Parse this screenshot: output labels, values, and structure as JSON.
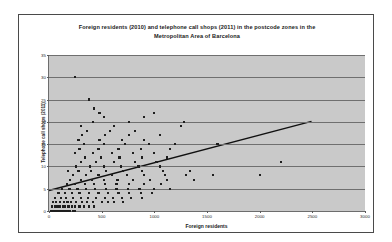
{
  "chart_data": {
    "type": "scatter",
    "title": "Foreign residents (2010) and telephone call shops (2011) in the postcode zones in the Metropolitan Area of Barcelona",
    "title_line1": "Foreign residents (2010) and telephone call shops (2011) in the postcode zones in the",
    "title_line2": "Metropolitan Area of Barcelona",
    "xlabel": "Foreign residents",
    "ylabel": "Telephone call shops (2011)",
    "xlim": [
      0,
      3000
    ],
    "ylim": [
      0,
      35
    ],
    "xticks": [
      0,
      500,
      1000,
      1500,
      2000,
      2500,
      3000
    ],
    "yticks": [
      0,
      5,
      10,
      15,
      20,
      25,
      30,
      35
    ],
    "grid": "horizontal",
    "legend": "none",
    "plot_background": "#c9c9c9",
    "gridline_color": "#6f6f6f",
    "marker_color": "#1e1e1e",
    "trendline_color": "#101010",
    "trendline": {
      "x_start": 0,
      "y_start": 4.4,
      "x_end": 2500,
      "y_end": 20.0
    },
    "points": [
      [
        20,
        0
      ],
      [
        35,
        0
      ],
      [
        50,
        0
      ],
      [
        65,
        0
      ],
      [
        80,
        0
      ],
      [
        95,
        0
      ],
      [
        110,
        0
      ],
      [
        125,
        0
      ],
      [
        145,
        0
      ],
      [
        160,
        0
      ],
      [
        180,
        0
      ],
      [
        200,
        0
      ],
      [
        225,
        0
      ],
      [
        250,
        0
      ],
      [
        30,
        1
      ],
      [
        55,
        1
      ],
      [
        75,
        1
      ],
      [
        100,
        1
      ],
      [
        130,
        1
      ],
      [
        155,
        1
      ],
      [
        185,
        1
      ],
      [
        215,
        1
      ],
      [
        245,
        1
      ],
      [
        290,
        1
      ],
      [
        330,
        1
      ],
      [
        380,
        1
      ],
      [
        430,
        1
      ],
      [
        40,
        2
      ],
      [
        70,
        2
      ],
      [
        105,
        2
      ],
      [
        140,
        2
      ],
      [
        175,
        2
      ],
      [
        210,
        2
      ],
      [
        260,
        2
      ],
      [
        310,
        2
      ],
      [
        360,
        2
      ],
      [
        420,
        2
      ],
      [
        500,
        2
      ],
      [
        560,
        2
      ],
      [
        620,
        2
      ],
      [
        700,
        2
      ],
      [
        60,
        3
      ],
      [
        115,
        3
      ],
      [
        165,
        3
      ],
      [
        230,
        3
      ],
      [
        300,
        3
      ],
      [
        370,
        3
      ],
      [
        450,
        3
      ],
      [
        530,
        3
      ],
      [
        610,
        3
      ],
      [
        690,
        3
      ],
      [
        780,
        3
      ],
      [
        880,
        3
      ],
      [
        90,
        4
      ],
      [
        150,
        4
      ],
      [
        220,
        4
      ],
      [
        290,
        4
      ],
      [
        380,
        4
      ],
      [
        470,
        4
      ],
      [
        560,
        4
      ],
      [
        660,
        4
      ],
      [
        760,
        4
      ],
      [
        870,
        4
      ],
      [
        980,
        4
      ],
      [
        120,
        5
      ],
      [
        195,
        5
      ],
      [
        270,
        5
      ],
      [
        350,
        5
      ],
      [
        440,
        5
      ],
      [
        540,
        5
      ],
      [
        640,
        5
      ],
      [
        750,
        5
      ],
      [
        860,
        5
      ],
      [
        1000,
        5
      ],
      [
        1150,
        5
      ],
      [
        170,
        6
      ],
      [
        250,
        6
      ],
      [
        340,
        6
      ],
      [
        430,
        6
      ],
      [
        530,
        6
      ],
      [
        640,
        6
      ],
      [
        760,
        6
      ],
      [
        900,
        6
      ],
      [
        1060,
        6
      ],
      [
        200,
        7
      ],
      [
        300,
        7
      ],
      [
        410,
        7
      ],
      [
        520,
        7
      ],
      [
        650,
        7
      ],
      [
        800,
        7
      ],
      [
        960,
        7
      ],
      [
        1120,
        7
      ],
      [
        1380,
        7
      ],
      [
        230,
        8
      ],
      [
        350,
        8
      ],
      [
        470,
        8
      ],
      [
        600,
        8
      ],
      [
        740,
        8
      ],
      [
        900,
        8
      ],
      [
        1100,
        8
      ],
      [
        1300,
        8
      ],
      [
        1560,
        8
      ],
      [
        2000,
        8
      ],
      [
        180,
        9
      ],
      [
        280,
        9
      ],
      [
        400,
        9
      ],
      [
        540,
        9
      ],
      [
        700,
        9
      ],
      [
        880,
        9
      ],
      [
        1080,
        9
      ],
      [
        1340,
        9
      ],
      [
        260,
        10
      ],
      [
        390,
        10
      ],
      [
        520,
        10
      ],
      [
        680,
        10
      ],
      [
        850,
        10
      ],
      [
        1050,
        10
      ],
      [
        300,
        11
      ],
      [
        450,
        11
      ],
      [
        620,
        11
      ],
      [
        820,
        11
      ],
      [
        1020,
        11
      ],
      [
        2200,
        11
      ],
      [
        340,
        12
      ],
      [
        490,
        12
      ],
      [
        670,
        12
      ],
      [
        880,
        12
      ],
      [
        1120,
        12
      ],
      [
        250,
        13
      ],
      [
        420,
        13
      ],
      [
        600,
        13
      ],
      [
        800,
        13
      ],
      [
        1000,
        13
      ],
      [
        290,
        14
      ],
      [
        470,
        14
      ],
      [
        660,
        14
      ],
      [
        870,
        14
      ],
      [
        1150,
        14
      ],
      [
        330,
        15
      ],
      [
        520,
        15
      ],
      [
        720,
        15
      ],
      [
        950,
        15
      ],
      [
        1200,
        15
      ],
      [
        1600,
        15
      ],
      [
        280,
        16
      ],
      [
        480,
        16
      ],
      [
        690,
        16
      ],
      [
        900,
        16
      ],
      [
        310,
        17
      ],
      [
        530,
        17
      ],
      [
        760,
        17
      ],
      [
        1050,
        17
      ],
      [
        360,
        18
      ],
      [
        580,
        18
      ],
      [
        820,
        18
      ],
      [
        300,
        19
      ],
      [
        620,
        19
      ],
      [
        1250,
        19
      ],
      [
        420,
        20
      ],
      [
        760,
        20
      ],
      [
        1280,
        20
      ],
      [
        520,
        21
      ],
      [
        900,
        21
      ],
      [
        480,
        22
      ],
      [
        1000,
        22
      ],
      [
        430,
        23
      ],
      [
        380,
        25
      ],
      [
        250,
        30
      ]
    ]
  }
}
